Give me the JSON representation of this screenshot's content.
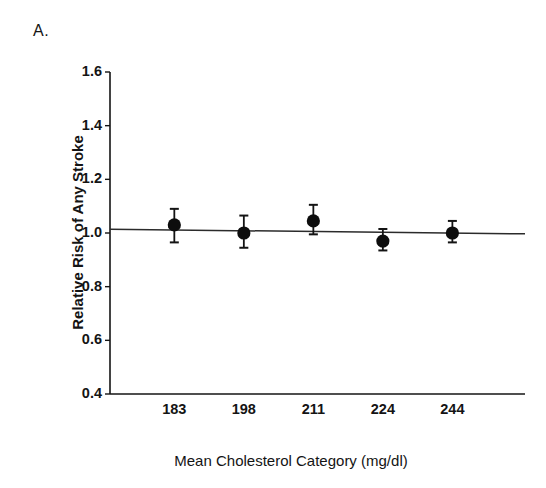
{
  "figure": {
    "panel_label": "A.",
    "background_color": "#ffffff",
    "ink_color": "#141414"
  },
  "chart_data": {
    "type": "scatter",
    "title": "",
    "subtitle": "",
    "panel": "A.",
    "xlabel": "Mean Cholesterol Category (mg/dl)",
    "ylabel": "Relative Risk of Any Stroke",
    "categories": [
      "183",
      "198",
      "211",
      "224",
      "244"
    ],
    "values": [
      1.03,
      1.0,
      1.045,
      0.97,
      1.0
    ],
    "error_low": [
      0.965,
      0.945,
      0.995,
      0.935,
      0.965
    ],
    "error_high": [
      1.09,
      1.065,
      1.105,
      1.015,
      1.045
    ],
    "series": [
      {
        "name": "Relative risk",
        "values": [
          1.03,
          1.0,
          1.045,
          0.97,
          1.0
        ],
        "error_low": [
          0.965,
          0.945,
          0.995,
          0.935,
          0.965
        ],
        "error_high": [
          1.09,
          1.065,
          1.105,
          1.015,
          1.045
        ],
        "marker": "filled-circle",
        "marker_color": "#0d0d0d"
      },
      {
        "name": "Trend line",
        "type": "line",
        "x": [
          "183",
          "244"
        ],
        "values": [
          1.012,
          0.995
        ],
        "line_color": "#2b2b2b"
      }
    ],
    "ylim": [
      0.4,
      1.6
    ],
    "yticks": [
      "1.6",
      "1.4",
      "1.2",
      "1.0",
      "0.8",
      "0.6",
      "0.4"
    ],
    "ytick_values": [
      1.6,
      1.4,
      1.2,
      1.0,
      0.8,
      0.6,
      0.4
    ],
    "xticks": [
      "183",
      "198",
      "211",
      "224",
      "244"
    ],
    "grid": false,
    "legend": false,
    "legend_position": "none",
    "reference_line": 1.0,
    "annotations": []
  }
}
